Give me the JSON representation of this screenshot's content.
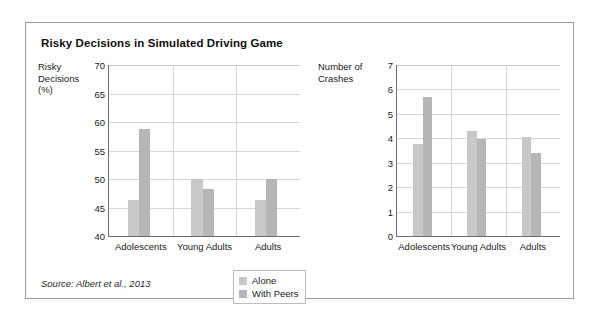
{
  "figure": {
    "title": "Risky Decisions in Simulated Driving Game",
    "source_note": "Source: Albert et al., 2013"
  },
  "legend": {
    "position": "bottom-center",
    "items": [
      {
        "label": "Alone",
        "color": "#c8c8c8"
      },
      {
        "label": "With Peers",
        "color": "#b6b6b6"
      }
    ]
  },
  "chart_data": [
    {
      "type": "bar",
      "title": "Risky Decisions in Simulated Driving Game",
      "panel": "left",
      "ylabel": "Risky\nDecisions\n(%)",
      "xlabel": "",
      "categories": [
        "Adolescents",
        "Young Adults",
        "Adults"
      ],
      "series": [
        {
          "name": "Alone",
          "values": [
            46.3,
            50.0,
            46.3
          ],
          "color": "#c8c8c8"
        },
        {
          "name": "With Peers",
          "values": [
            58.7,
            48.3,
            50.0
          ],
          "color": "#b6b6b6"
        }
      ],
      "ylim": [
        40,
        70
      ],
      "yticks": [
        40,
        45,
        50,
        55,
        60,
        65,
        70
      ],
      "grid": true,
      "legend": "bottom-center"
    },
    {
      "type": "bar",
      "panel": "right",
      "ylabel": "Number of\nCrashes",
      "xlabel": "",
      "categories": [
        "Adolescents",
        "Young Adults",
        "Adults"
      ],
      "series": [
        {
          "name": "Alone",
          "values": [
            3.75,
            4.28,
            4.05
          ],
          "color": "#c8c8c8"
        },
        {
          "name": "With Peers",
          "values": [
            5.68,
            3.98,
            3.38
          ],
          "color": "#b6b6b6"
        }
      ],
      "ylim": [
        0,
        7
      ],
      "yticks": [
        0,
        1,
        2,
        3,
        4,
        5,
        6,
        7
      ],
      "grid": true,
      "legend": "bottom-center"
    }
  ]
}
